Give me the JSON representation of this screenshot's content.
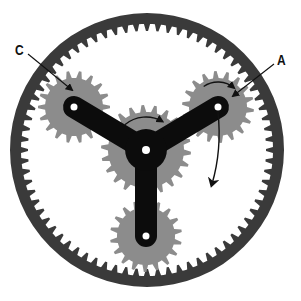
{
  "diagram": {
    "type": "planetary-gear-set",
    "colors": {
      "ring": "#3a3a3a",
      "gear": "#8c8c8c",
      "carrier": "#0c0c0c",
      "hole": "#ffffff",
      "arrow": "#111111",
      "background": "#ffffff"
    },
    "ring_gear": {
      "cx": 147,
      "cy": 150,
      "outer_r": 137,
      "tip_r": 119,
      "root_r": 126,
      "teeth": 72
    },
    "sun_gear": {
      "cx": 146,
      "cy": 150,
      "tip_r": 45,
      "root_r": 38,
      "teeth": 22
    },
    "planet_gears": [
      {
        "id": "C",
        "cx": 74,
        "cy": 107,
        "tip_r": 36,
        "root_r": 29,
        "teeth": 18
      },
      {
        "id": "A",
        "cx": 218,
        "cy": 107,
        "tip_r": 36,
        "root_r": 29,
        "teeth": 18
      },
      {
        "id": "bottom",
        "cx": 146,
        "cy": 236,
        "tip_r": 36,
        "root_r": 29,
        "teeth": 18
      }
    ],
    "carrier": {
      "arm_width": 22,
      "hub": {
        "cx": 146,
        "cy": 150
      }
    },
    "labels": [
      {
        "text": "C",
        "x": 14,
        "y": 42,
        "target_x": 72,
        "target_y": 90
      },
      {
        "text": "A",
        "x": 276,
        "y": 52,
        "target_x": 233,
        "target_y": 96
      }
    ],
    "rotation_arrows": [
      {
        "name": "sun-rotation-arrow",
        "cx": 146,
        "cy": 150,
        "r": 33,
        "start_deg": 230,
        "end_deg": 300
      },
      {
        "name": "planet-a-rotation-arrow",
        "cx": 218,
        "cy": 107,
        "r": 25,
        "start_deg": 235,
        "end_deg": 310
      }
    ],
    "carrier_arrow": {
      "from_x": 218,
      "from_y": 112,
      "ctrl_x": 222,
      "ctrl_y": 150,
      "to_x": 212,
      "to_y": 184
    }
  }
}
